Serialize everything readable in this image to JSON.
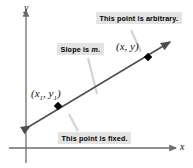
{
  "figure": {
    "name": "point-slope-line-diagram",
    "axes": {
      "y_label": "y",
      "x_label": "x"
    },
    "points": [
      {
        "id": "fixed-point",
        "label_prefix": "(",
        "label": "(x1, y1)",
        "var_x": "x",
        "sub_x": "1",
        "sep": ", ",
        "var_y": "y",
        "sub_y": "1",
        "close": ")"
      },
      {
        "id": "arbitrary-point",
        "label": "(x, y)",
        "open": "(",
        "var_x": "x",
        "sep": ", ",
        "var_y": "y",
        "close": ")"
      }
    ],
    "callouts": [
      {
        "id": "arbitrary",
        "text": "This point is arbitrary."
      },
      {
        "id": "slope",
        "text_before": "Slope is ",
        "symbol": "m",
        "text_after": ".",
        "text": "Slope is m."
      },
      {
        "id": "fixed",
        "text": "This point is fixed."
      }
    ],
    "colors": {
      "line": "#4d4d4d",
      "axis": "#6e6e6e",
      "callout_bg": "#e3e3e3",
      "leader": "#d0d0d0",
      "dot": "#000000",
      "text": "#000000"
    }
  }
}
